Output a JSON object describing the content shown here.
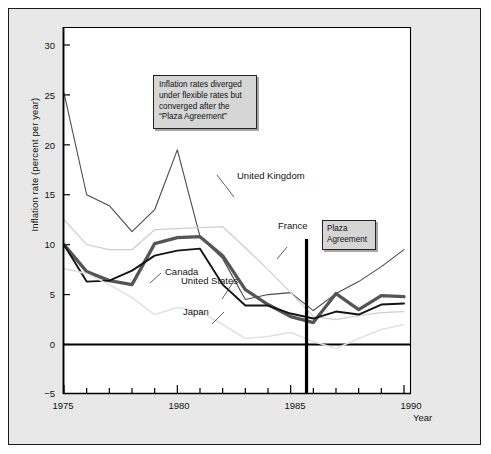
{
  "chart_data": {
    "type": "line",
    "title": "",
    "xlabel": "Year",
    "ylabel": "Inflation rate (percent per year)",
    "xlim": [
      1975,
      1990
    ],
    "ylim": [
      -5,
      32
    ],
    "yticks": [
      30,
      25,
      20,
      15,
      10,
      5,
      0,
      -5
    ],
    "ytick_labels": [
      "30",
      "25",
      "20",
      "15",
      "10",
      "5",
      "0",
      "−5"
    ],
    "xticks": [
      1975,
      1980,
      1985,
      1990
    ],
    "xtick_labels": [
      "1975",
      "1980",
      "1985",
      "1990"
    ],
    "minor_xticks": [
      1976,
      1977,
      1978,
      1979,
      1981,
      1982,
      1983,
      1984,
      1986,
      1987,
      1988,
      1989
    ],
    "grid": false,
    "legend_position": "inline-labels",
    "x": [
      1975,
      1976,
      1977,
      1978,
      1979,
      1980,
      1981,
      1982,
      1983,
      1984,
      1985,
      1986,
      1987,
      1988,
      1989,
      1990
    ],
    "series": [
      {
        "name": "United Kingdom",
        "color": "#4a4a4a",
        "width": 1.1,
        "values": [
          25.2,
          15.0,
          13.9,
          11.3,
          13.5,
          19.5,
          10.8,
          8.6,
          4.5,
          5.0,
          5.2,
          3.4,
          5.1,
          6.3,
          7.8,
          9.5
        ]
      },
      {
        "name": "France",
        "color": "#cfcfcf",
        "width": 1.3,
        "values": [
          12.5,
          10.0,
          9.5,
          9.5,
          11.5,
          11.6,
          11.7,
          11.8,
          9.7,
          7.5,
          5.2,
          2.8,
          2.5,
          2.9,
          3.2,
          3.3
        ]
      },
      {
        "name": "Canada",
        "color": "#555555",
        "width": 3.3,
        "values": [
          10.0,
          7.3,
          6.4,
          6.0,
          10.1,
          10.7,
          10.8,
          8.9,
          5.5,
          4.0,
          2.8,
          2.2,
          5.1,
          3.5,
          4.9,
          4.8
        ]
      },
      {
        "name": "United States",
        "color": "#141414",
        "width": 1.9,
        "values": [
          10.0,
          6.3,
          6.4,
          7.4,
          8.9,
          9.4,
          9.6,
          6.0,
          3.9,
          3.9,
          3.1,
          2.6,
          3.3,
          3.0,
          4.0,
          4.1
        ]
      },
      {
        "name": "Japan",
        "color": "#e2e2e2",
        "width": 1.6,
        "values": [
          7.6,
          7.1,
          6.0,
          4.7,
          3.0,
          3.7,
          3.3,
          2.0,
          0.6,
          0.8,
          1.2,
          0.3,
          -0.4,
          0.6,
          1.5,
          2.0
        ]
      }
    ],
    "annotations": [
      {
        "name": "plaza-marker",
        "type": "vline",
        "x": 1985.7,
        "label": "Plaza Agreement"
      }
    ]
  },
  "annotation": {
    "line1": "Inflation rates diverged",
    "line2": "under flexible rates but",
    "line3": "converged after the",
    "line4": "“Plaza Agreement”"
  },
  "plaza": {
    "line1": "Plaza",
    "line2": "Agreement"
  },
  "series_labels": {
    "uk": "United Kingdom",
    "france": "France",
    "canada": "Canada",
    "us": "United States",
    "japan": "Japan"
  },
  "axes": {
    "ylabel": "Inflation rate (percent per year)",
    "xlabel": "Year",
    "ytick_labels": [
      "30",
      "25",
      "20",
      "15",
      "10",
      "5",
      "0",
      "−5"
    ],
    "xtick_labels": [
      "1975",
      "1980",
      "1985",
      "1990"
    ]
  }
}
